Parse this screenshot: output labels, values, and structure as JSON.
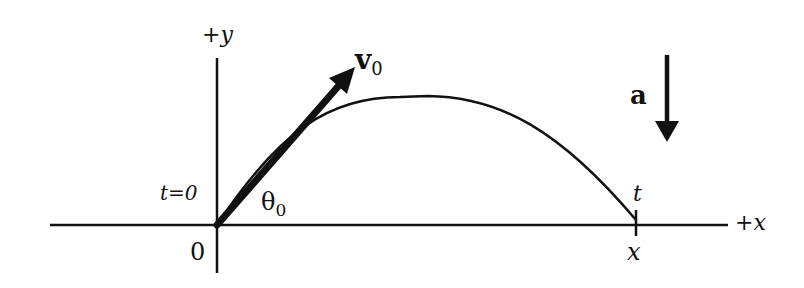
{
  "diagram": {
    "type": "projectile-motion",
    "colors": {
      "ink": "#111111",
      "background": "#ffffff"
    },
    "axes": {
      "x_label": "+x",
      "y_label": "+y",
      "origin_label": "0"
    },
    "labels": {
      "initial_velocity": {
        "symbol": "v",
        "subscript": "0"
      },
      "launch_angle": {
        "symbol": "θ",
        "subscript": "0"
      },
      "start_time": "t=0",
      "end_time": "t",
      "end_position": "x",
      "acceleration": "a"
    }
  }
}
